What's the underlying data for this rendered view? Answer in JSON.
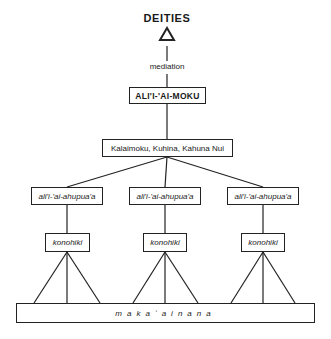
{
  "diagram": {
    "apex": "DEITIES",
    "apex_icon": "triangle-outline",
    "link_label": "mediation",
    "ruler": "ALI'I-'AI-MOKU",
    "council": "Kalaimoku, Kuhina, Kahuna Nui",
    "districts": [
      {
        "chief": "ali'i-'ai-ahupua'a",
        "overseer": "konohiki"
      },
      {
        "chief": "ali'i-'ai-ahupua'a",
        "overseer": "konohiki"
      },
      {
        "chief": "ali'i-'ai-ahupua'a",
        "overseer": "konohiki"
      }
    ],
    "base": "makaʻainana"
  }
}
